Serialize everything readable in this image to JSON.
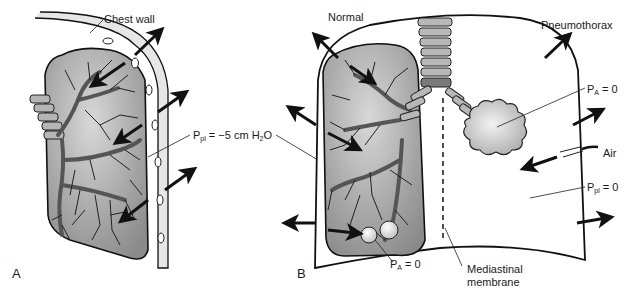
{
  "panels": {
    "a": {
      "letter": "A",
      "chest_wall_label": "Chest wall",
      "pleural_pressure": {
        "symbol": "P",
        "subscript": "pl",
        "rest": " = −5 cm H",
        "sub2": "2",
        "tail": "O"
      }
    },
    "b": {
      "letter": "B",
      "normal_label": "Normal",
      "pneumothorax_label": "Pneumothorax",
      "alveolar_pressure_right": {
        "symbol": "P",
        "subscript": "A",
        "rest": " = 0"
      },
      "alveolar_pressure_left": {
        "symbol": "P",
        "subscript": "A",
        "rest": " = 0"
      },
      "pleural_pressure": {
        "symbol": "P",
        "subscript": "pl",
        "rest": " = 0"
      },
      "air_label": "Air",
      "mediastinal_label_line1": "Mediastinal",
      "mediastinal_label_line2": "membrane"
    }
  },
  "colors": {
    "lung_fill": "#8f8f8f",
    "lung_light": "#d4d4d4",
    "airway": "#6e6e6e",
    "outline": "#111111",
    "chest_wall": "#e8e8e8"
  }
}
